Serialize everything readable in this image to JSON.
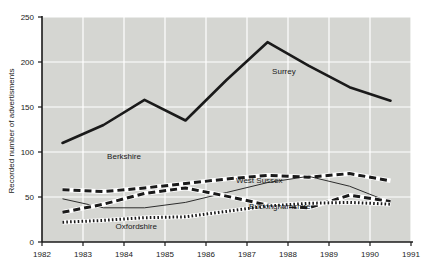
{
  "chart_data": {
    "type": "line",
    "title": "",
    "xlabel": "",
    "ylabel": "Recorded number of advertisments",
    "xlim": [
      1982,
      1991
    ],
    "ylim": [
      0,
      250
    ],
    "yticks": [
      0,
      50,
      100,
      150,
      200,
      250
    ],
    "xticks": [
      1982,
      1983,
      1984,
      1985,
      1986,
      1987,
      1988,
      1989,
      1990,
      1991
    ],
    "ytick_labels": [
      "0",
      "50",
      "100",
      "150",
      "200",
      "250"
    ],
    "xtick_labels": [
      "1982",
      "1983",
      "1984",
      "1985",
      "1986",
      "1987",
      "1988",
      "1989",
      "1990",
      "1991"
    ],
    "grid": true,
    "grid_color": "#ffffff",
    "plot_background": "#d5d6d2",
    "legend_position": "inline-labels",
    "x": [
      1982.5,
      1983.5,
      1984.5,
      1985.5,
      1986.5,
      1987.5,
      1988.5,
      1989.5,
      1990.5
    ],
    "series": [
      {
        "name": "Surrey",
        "style": "thick-solid",
        "color": "#1a1a1a",
        "values": [
          110,
          130,
          158,
          135,
          180,
          222,
          196,
          172,
          157
        ],
        "label_x": 1987.9,
        "label_y": 190
      },
      {
        "name": "Berkshire",
        "style": "thick-dashed",
        "color": "#1a1a1a",
        "values": [
          58,
          56,
          60,
          65,
          70,
          74,
          72,
          76,
          68
        ],
        "label_x": 1984.0,
        "label_y": 96
      },
      {
        "name": "West Sussex",
        "style": "thin-solid",
        "color": "#1a1a1a",
        "values": [
          48,
          38,
          38,
          44,
          55,
          66,
          73,
          62,
          44
        ],
        "label_x": 1987.3,
        "label_y": 69
      },
      {
        "name": "Buckinghamshire",
        "style": "thick-dashed",
        "color": "#1a1a1a",
        "values": [
          33,
          42,
          54,
          60,
          51,
          41,
          38,
          52,
          45
        ],
        "label_x": 1987.8,
        "label_y": 40
      },
      {
        "name": "Oxfordshire",
        "style": "dotted",
        "color": "#1a1a1a",
        "values": [
          22,
          24,
          27,
          28,
          34,
          40,
          43,
          44,
          42
        ],
        "label_x": 1984.3,
        "label_y": 18
      }
    ]
  }
}
